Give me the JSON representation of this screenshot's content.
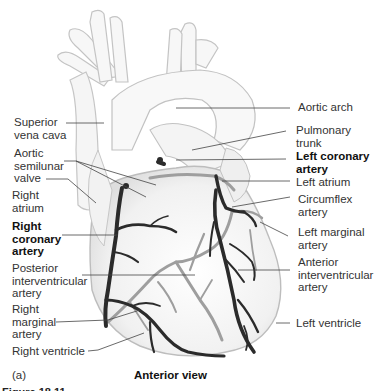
{
  "figure": {
    "panel_label": "(a)",
    "view_title": "Anterior view",
    "figure_caption_cut": "Figure 18.11"
  },
  "labels_left": [
    {
      "id": "superior-vena-cava",
      "text": "Superior\nvena cava",
      "bold": false
    },
    {
      "id": "aortic-semilunar-valve",
      "text": "Aortic\nsemilunar\nvalve",
      "bold": false
    },
    {
      "id": "right-atrium",
      "text": "Right\natrium",
      "bold": false
    },
    {
      "id": "right-coronary-artery",
      "text": "Right\ncoronary\nartery",
      "bold": true
    },
    {
      "id": "posterior-interventricular-artery",
      "text": "Posterior\ninterventricular\nartery",
      "bold": false
    },
    {
      "id": "right-marginal-artery",
      "text": "Right\nmarginal\nartery",
      "bold": false
    },
    {
      "id": "right-ventricle",
      "text": "Right ventricle",
      "bold": false
    }
  ],
  "labels_right": [
    {
      "id": "aortic-arch",
      "text": "Aortic arch",
      "bold": false
    },
    {
      "id": "pulmonary-trunk",
      "text": "Pulmonary\ntrunk",
      "bold": false
    },
    {
      "id": "left-coronary-artery",
      "text": "Left coronary\nartery",
      "bold": true
    },
    {
      "id": "left-atrium",
      "text": "Left atrium",
      "bold": false
    },
    {
      "id": "circumflex-artery",
      "text": "Circumflex\nartery",
      "bold": false
    },
    {
      "id": "left-marginal-artery",
      "text": "Left marginal\nartery",
      "bold": false
    },
    {
      "id": "anterior-interventricular-artery",
      "text": "Anterior\ninterventricular\nartery",
      "bold": false
    },
    {
      "id": "left-ventricle",
      "text": "Left ventricle",
      "bold": false
    }
  ],
  "colors": {
    "outline": "#b9b9b9",
    "fill": "#f3f3f3",
    "artery_front": "#2b2b2b",
    "artery_back": "#9a9a9a",
    "leader": "#444444"
  }
}
